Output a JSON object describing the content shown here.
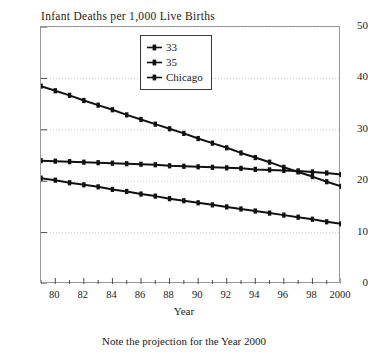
{
  "top_cut_text": "· · · · · ·",
  "chart_title": "Infant Deaths per 1,000 Live Births",
  "axis_title_x": "Year",
  "caption": "Note the projection for the Year 2000",
  "legend": {
    "items": [
      {
        "label": "33",
        "color": "#111111",
        "marker": "line-dot-marker"
      },
      {
        "label": "35",
        "color": "#111111",
        "marker": "line-dot-marker"
      },
      {
        "label": "Chicago",
        "color": "#111111",
        "marker": "line-dot-marker"
      }
    ]
  },
  "chart_data": {
    "type": "line",
    "title": "Infant Deaths per 1,000 Live Births",
    "xlabel": "Year",
    "ylabel": "",
    "xlim": [
      79,
      100
    ],
    "ylim": [
      0,
      50
    ],
    "grid": true,
    "legend_position": "top-center",
    "ytick_values": [
      0,
      10,
      20,
      30,
      40,
      50
    ],
    "ytick_labels": [
      "0",
      "10",
      "20",
      "30",
      "40",
      "50"
    ],
    "xtick_values": [
      80,
      82,
      84,
      86,
      88,
      90,
      92,
      94,
      96,
      98,
      100
    ],
    "xtick_labels": [
      "80",
      "82",
      "84",
      "86",
      "88",
      "90",
      "92",
      "94",
      "96",
      "98",
      "2000"
    ],
    "x": [
      79,
      80,
      81,
      82,
      83,
      84,
      85,
      86,
      87,
      88,
      89,
      90,
      91,
      92,
      93,
      94,
      95,
      96,
      97,
      98,
      99,
      100
    ],
    "series": [
      {
        "name": "33",
        "color": "#111111",
        "values": [
          38.5,
          37.6,
          36.7,
          35.7,
          34.8,
          33.9,
          32.9,
          32.0,
          31.1,
          30.2,
          29.3,
          28.3,
          27.4,
          26.5,
          25.5,
          24.6,
          23.7,
          22.7,
          21.8,
          20.9,
          19.9,
          19.0
        ]
      },
      {
        "name": "35",
        "color": "#111111",
        "values": [
          24.0,
          23.9,
          23.8,
          23.7,
          23.6,
          23.5,
          23.4,
          23.3,
          23.2,
          23.0,
          22.9,
          22.8,
          22.7,
          22.6,
          22.5,
          22.3,
          22.2,
          22.1,
          22.0,
          21.8,
          21.6,
          21.3
        ]
      },
      {
        "name": "Chicago",
        "color": "#111111",
        "values": [
          20.6,
          20.2,
          19.7,
          19.3,
          18.9,
          18.4,
          18.0,
          17.5,
          17.1,
          16.6,
          16.2,
          15.8,
          15.4,
          15.0,
          14.6,
          14.2,
          13.8,
          13.4,
          13.0,
          12.6,
          12.1,
          11.7
        ]
      }
    ]
  }
}
